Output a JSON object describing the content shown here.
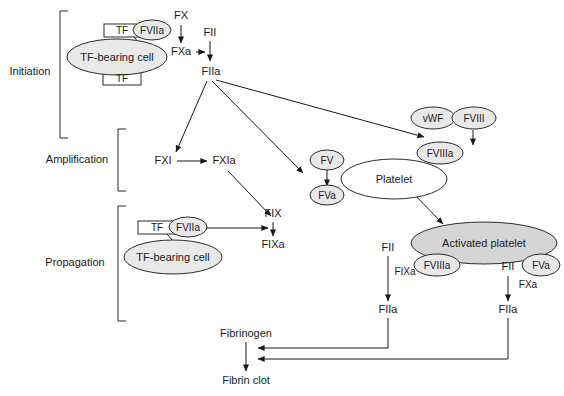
{
  "diagram": {
    "type": "flow-diagram",
    "colors": {
      "shape_fill": "#e8e8e8",
      "activated_fill": "#d5d5d5",
      "stroke": "#2b2b2b",
      "text": "#1a1a1a",
      "background": "#ffffff"
    },
    "stages": [
      {
        "id": "initiation",
        "label": "Initiation"
      },
      {
        "id": "amplification",
        "label": "Amplification"
      },
      {
        "id": "propagation",
        "label": "Propagation"
      }
    ],
    "nodes": {
      "init_tf_top": "TF",
      "init_fviia": "FVIIa",
      "init_cell": "TF-bearing cell",
      "init_tf_bottom": "TF",
      "fx": "FX",
      "fxa": "FXa",
      "fii_top": "FII",
      "fiia_top": "FIIa",
      "fxi": "FXI",
      "fxia": "FXIa",
      "vwf": "vWF",
      "fviii": "FVIII",
      "fviiia_amp": "FVIIIa",
      "fv": "FV",
      "fva_amp": "FVa",
      "platelet": "Platelet",
      "activated_platelet": "Activated platelet",
      "prop_tf": "TF",
      "prop_fviia": "FVIIa",
      "prop_cell": "TF-bearing cell",
      "fix": "FIX",
      "fixa": "FIXa",
      "fii_left": "FII",
      "fixa_cofactor": "FIXa",
      "fviiia_prop": "FVIIIa",
      "fiia_left": "FIIa",
      "fii_right": "FII",
      "fva_prop": "FVa",
      "fxa_cofactor": "FXa",
      "fiia_right": "FIIa",
      "fibrinogen": "Fibrinogen",
      "fibrin_clot": "Fibrin clot"
    }
  }
}
